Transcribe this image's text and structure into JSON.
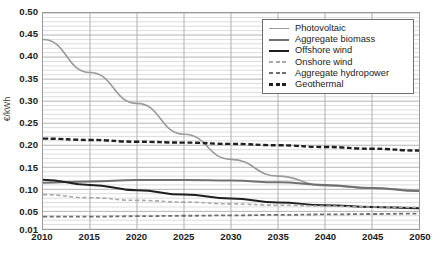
{
  "chart_data": {
    "type": "line",
    "title": "",
    "xlabel": "",
    "ylabel": "€/kWh",
    "xlim": [
      2010,
      2050
    ],
    "ylim": [
      0.01,
      0.5
    ],
    "grid": true,
    "legend_position": "top-right",
    "x_ticks": [
      2010,
      2015,
      2020,
      2025,
      2030,
      2035,
      2040,
      2045,
      2050
    ],
    "y_ticks": [
      "0.01",
      "0.05",
      "0.10",
      "0.15",
      "0.20",
      "0.25",
      "0.30",
      "0.35",
      "0.40",
      "0.45",
      "0.50"
    ],
    "y_tick_values": [
      0.01,
      0.05,
      0.1,
      0.15,
      0.2,
      0.25,
      0.3,
      0.35,
      0.4,
      0.45,
      0.5
    ],
    "x": [
      2010,
      2015,
      2020,
      2025,
      2030,
      2035,
      2040,
      2045,
      2050
    ],
    "series": [
      {
        "name": "Photovoltaic",
        "color": "#9a9a9a",
        "style": "solid",
        "width": 1.6,
        "values": [
          0.44,
          0.365,
          0.295,
          0.225,
          0.168,
          0.13,
          0.108,
          0.103,
          0.098
        ]
      },
      {
        "name": "Aggregate biomass",
        "color": "#707070",
        "style": "solid",
        "width": 2.0,
        "values": [
          0.115,
          0.118,
          0.121,
          0.121,
          0.12,
          0.116,
          0.11,
          0.103,
          0.096
        ]
      },
      {
        "name": "Offshore wind",
        "color": "#1f1f1f",
        "style": "solid",
        "width": 2.0,
        "values": [
          0.122,
          0.11,
          0.098,
          0.088,
          0.079,
          0.07,
          0.064,
          0.06,
          0.057
        ]
      },
      {
        "name": "Onshore wind",
        "color": "#a8a8a8",
        "style": "dashed",
        "width": 1.6,
        "values": [
          0.088,
          0.081,
          0.075,
          0.071,
          0.067,
          0.064,
          0.062,
          0.06,
          0.059
        ]
      },
      {
        "name": "Aggregate hydropower",
        "color": "#6f6f6f",
        "style": "dashed",
        "width": 1.8,
        "values": [
          0.038,
          0.038,
          0.039,
          0.04,
          0.041,
          0.042,
          0.043,
          0.044,
          0.045
        ]
      },
      {
        "name": "Geothermal",
        "color": "#1f1f1f",
        "style": "dashed",
        "width": 2.4,
        "values": [
          0.215,
          0.212,
          0.208,
          0.206,
          0.203,
          0.2,
          0.196,
          0.192,
          0.188
        ]
      }
    ],
    "legend_entries": [
      "Photovoltaic",
      "Aggregate biomass",
      "Offshore wind",
      "Onshore wind",
      "Aggregate hydropower",
      "Geothermal"
    ]
  }
}
